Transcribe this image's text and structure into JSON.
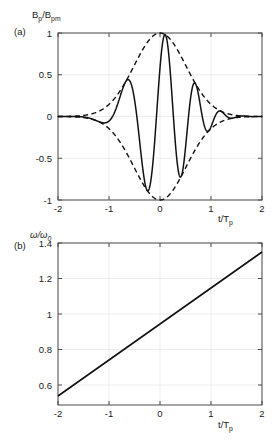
{
  "figure": {
    "background": "#ffffff",
    "axis_color": "#4d4d4d",
    "grid_color": "#e8e8e8",
    "curve_color": "#111111"
  },
  "panel_a": {
    "tag": "(a)",
    "ylabel_main": "B",
    "ylabel_sub1": "p",
    "ylabel_slash": "/B",
    "ylabel_sub2": "pm",
    "xlabel_main": "t/T",
    "xlabel_sub": "p",
    "yticks": [
      "1",
      "0.5",
      "0",
      "-0.5",
      "-1"
    ],
    "ytick_values": [
      1,
      0.5,
      0,
      -0.5,
      -1
    ],
    "xticks": [
      "-2",
      "-1",
      "0",
      "1",
      "2"
    ],
    "xtick_values": [
      -2,
      -1,
      0,
      1,
      2
    ]
  },
  "panel_b": {
    "tag": "(b)",
    "ylabel_main": "ω/ω",
    "ylabel_sub": "0",
    "xlabel_main": "t/T",
    "xlabel_sub": "p",
    "yticks": [
      "1.4",
      "1.2",
      "1",
      "0.8",
      "0.6"
    ],
    "ytick_values": [
      1.4,
      1.2,
      1,
      0.8,
      0.6
    ],
    "xticks": [
      "-2",
      "-1",
      "0",
      "1",
      "2"
    ],
    "xtick_values": [
      -2,
      -1,
      0,
      1,
      2
    ]
  },
  "chart_data": [
    {
      "type": "line",
      "panel": "(a)",
      "title": "",
      "xlabel": "t/T_p",
      "ylabel": "B_p/B_pm",
      "xlim": [
        -2,
        2
      ],
      "ylim": [
        -1,
        1
      ],
      "grid": true,
      "legend": null,
      "series": [
        {
          "name": "chirped carrier",
          "style": "solid",
          "description": "Gaussian-enveloped linearly-chirped oscillation; instantaneous frequency rises from 0.6 to 1.4 times omega_0 across the window",
          "model": {
            "form": "exp(-(t/0.72)^2) * cos(2*pi*(f0*t + 0.5*k*t^2) + phi)",
            "envelope_sigma": 0.72,
            "f0": 1.45,
            "chirp_rate_k": 0.58,
            "phase_offset_rad": -0.95
          }
        },
        {
          "name": "upper envelope",
          "style": "dashed",
          "description": "+exp(-(t/0.72)^2)"
        },
        {
          "name": "lower envelope",
          "style": "dashed",
          "description": "-exp(-(t/0.72)^2)"
        }
      ]
    },
    {
      "type": "line",
      "panel": "(b)",
      "title": "",
      "xlabel": "t/T_p",
      "ylabel": "omega/omega_0",
      "xlim": [
        -2,
        2
      ],
      "ylim": [
        0.55,
        1.45
      ],
      "grid": true,
      "legend": null,
      "series": [
        {
          "name": "instantaneous frequency",
          "style": "solid",
          "x": [
            -2,
            -1,
            0,
            1,
            2
          ],
          "values": [
            0.6,
            0.8,
            1.0,
            1.2,
            1.4
          ],
          "slope": 0.2,
          "intercept": 1.0
        }
      ]
    }
  ]
}
